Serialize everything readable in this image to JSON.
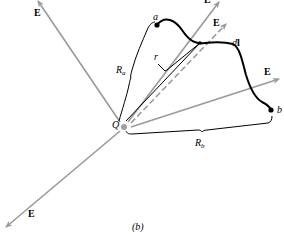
{
  "figure": {
    "caption": "(b)",
    "charge_label": "Q",
    "field_label": "E",
    "point_a_label": "a",
    "point_b_label": "b",
    "segment_label": "dl",
    "segment_label_d": "d",
    "segment_label_l": "l",
    "radius_label": "r",
    "Ra_main": "R",
    "Ra_sub": "a",
    "Rb_main": "R",
    "Rb_sub": "b",
    "field_arrows": [
      {
        "direction": "upper-left",
        "label": "E"
      },
      {
        "direction": "lower-left",
        "label": "E"
      },
      {
        "direction": "upper-right",
        "label": "E"
      },
      {
        "direction": "upper-right-dashed",
        "label": "E"
      },
      {
        "direction": "right",
        "label": "E"
      }
    ],
    "colors": {
      "field_line": "#9a9a9a",
      "path": "#000000",
      "charge": "#a0a0a0"
    }
  }
}
